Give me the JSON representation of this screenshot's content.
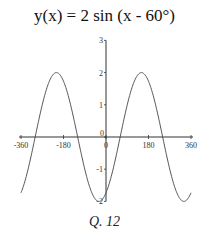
{
  "chart_data": {
    "type": "line",
    "title": "y(x) = 2 sin (x - 60°)",
    "caption": "Q. 12",
    "xlabel": "",
    "ylabel": "",
    "xlim": [
      -360,
      360
    ],
    "ylim": [
      -2,
      3
    ],
    "x_ticks": [
      "-360",
      "-180",
      "0",
      "180",
      "360"
    ],
    "y_ticks": [
      "-2",
      "-1",
      "0",
      "1",
      "2",
      "3"
    ],
    "grid": false,
    "series": [
      {
        "name": "y(x) = 2 sin (x - 60°)",
        "function": "2*sin(x-60deg)",
        "x": [
          -360,
          -330,
          -300,
          -270,
          -240,
          -210,
          -180,
          -150,
          -120,
          -90,
          -60,
          -30,
          0,
          30,
          60,
          90,
          120,
          150,
          180,
          210,
          240,
          270,
          300,
          330,
          360
        ],
        "values": [
          -1.73,
          -1,
          0,
          1,
          1.73,
          2,
          1.73,
          1,
          0,
          -1,
          -1.73,
          -2,
          -1.73,
          -1,
          0,
          1,
          1.73,
          2,
          1.73,
          1,
          0,
          -1,
          -1.73,
          -2,
          -1.73
        ]
      }
    ]
  }
}
